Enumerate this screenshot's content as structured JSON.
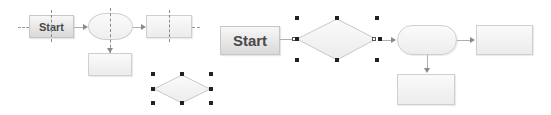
{
  "left_diagram": {
    "start_label": "Start",
    "shapes": [
      "start-process",
      "terminator-oval",
      "process-right",
      "process-below",
      "decision-diamond-selected"
    ]
  },
  "right_diagram": {
    "start_label": "Start",
    "shapes": [
      "start-process",
      "decision-diamond-selected",
      "terminator-pill",
      "process-right",
      "process-below"
    ]
  },
  "colors": {
    "shape_border": "#cfcfcf",
    "start_gradient_top": "#f7f7f7",
    "start_gradient_bottom": "#d9d9d9",
    "start_text": "#4a4a4a",
    "handle": "#222222",
    "connector": "#b0b0b0"
  }
}
